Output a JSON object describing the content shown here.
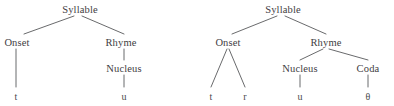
{
  "figure": {
    "background_color": "#ffffff",
    "line_color": "#58595b",
    "text_color": "#3f4043"
  },
  "trees": [
    {
      "name": "tree-tu",
      "transcription": "tu",
      "nodes": {
        "root": "Syllable",
        "onset": "Onset",
        "rhyme": "Rhyme",
        "nucleus": "Nucleus"
      },
      "leaves": {
        "onset_leaf": "t",
        "nucleus_leaf": "u"
      }
    },
    {
      "name": "tree-truth",
      "transcription": "truθ",
      "nodes": {
        "root": "Syllable",
        "onset": "Onset",
        "rhyme": "Rhyme",
        "nucleus": "Nucleus",
        "coda": "Coda"
      },
      "leaves": {
        "onset_leaf_1": "t",
        "onset_leaf_2": "r",
        "nucleus_leaf": "u",
        "coda_leaf": "θ"
      }
    }
  ]
}
